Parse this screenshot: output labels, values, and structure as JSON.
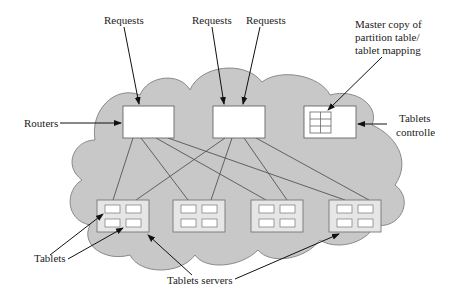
{
  "diagram": {
    "labels": {
      "requests_1": "Requests",
      "requests_2": "Requests",
      "requests_3": "Requests",
      "routers": "Routers",
      "master_line1": "Master copy of",
      "master_line2": "partition table/",
      "master_line3": "tablet mapping",
      "controller_line1": "Tablets",
      "controller_line2": "controlle",
      "tablets": "Tablets",
      "tablet_servers": "Tablets servers"
    },
    "colors": {
      "cloud_fill": "#c8c8c8",
      "cloud_stroke": "#8a8a8a",
      "box_fill": "#ffffff",
      "server_fill": "#e6e6e6",
      "line": "#555555",
      "arrow": "#111111"
    },
    "nodes": {
      "routers": 2,
      "tablet_servers": 4,
      "tablets_per_server": 4
    }
  }
}
